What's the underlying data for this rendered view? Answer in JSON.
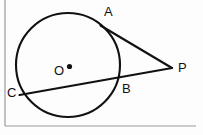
{
  "figure": {
    "kind": "circle-tangent-secant-geometry-diagram",
    "background_color": "#fdfdfd",
    "stroke_color": "#111111",
    "border_color": "#9a9a9a",
    "canvas": {
      "width": 203,
      "height": 135
    }
  },
  "frame": {
    "left_rule_x": 5,
    "bottom_rule_y": 126,
    "right_x": 196
  },
  "circle": {
    "name": "main-circle",
    "center_x": 68,
    "center_y": 65,
    "radius": 52,
    "stroke_width": 2.1
  },
  "center_point": {
    "name": "center-dot",
    "x": 69.5,
    "y": 66.5,
    "radius": 2.6
  },
  "points": {
    "A": {
      "label": "A",
      "x": 100.5,
      "y": 25.5,
      "label_x": 104,
      "label_y": 16
    },
    "B": {
      "label": "B",
      "x": 118.5,
      "y": 79.5,
      "label_x": 122,
      "label_y": 93
    },
    "C": {
      "label": "C",
      "x": 19.5,
      "y": 95.0,
      "label_x": 7,
      "label_y": 97
    },
    "O": {
      "label": "O",
      "x": 68,
      "y": 65,
      "label_x": 54,
      "label_y": 75
    },
    "P": {
      "label": "P",
      "x": 172.0,
      "y": 68.0,
      "label_x": 178,
      "label_y": 72
    }
  },
  "segments": [
    {
      "name": "tangent-AP",
      "from": "A",
      "to": "P",
      "stroke_width": 2.1
    },
    {
      "name": "secant-CP",
      "from": "C",
      "to": "P",
      "stroke_width": 2.1
    }
  ],
  "labels_order": [
    "A",
    "P",
    "B",
    "C",
    "O"
  ]
}
